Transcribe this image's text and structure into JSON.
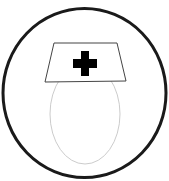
{
  "icon": {
    "semantic": "nurse-icon",
    "description": "Nurse head with cap bearing a cross, inside a circle",
    "colors": {
      "background": "#ffffff",
      "circle_stroke": "#1a1a1a",
      "cap_stroke": "#444444",
      "cross_fill": "#000000",
      "face_stroke": "#cccccc"
    }
  }
}
